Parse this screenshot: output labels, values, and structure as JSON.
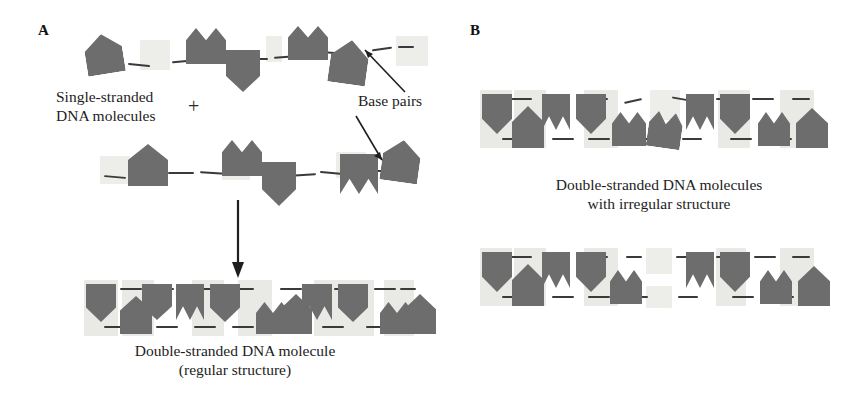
{
  "figure": {
    "type": "scientific-diagram",
    "background_color": "#ffffff",
    "nucleotide_color": "#6d6d6d",
    "basepair_halo_color": "#e9e9e5",
    "backbone_color": "#3a3a3a",
    "text_color": "#1d1d1d"
  },
  "panel_a": {
    "label": "A",
    "single_stranded_caption": "Single-stranded\nDNA molecules",
    "plus_symbol": "+",
    "base_pairs_label": "Base pairs",
    "product_caption": "Double-stranded DNA molecule\n(regular structure)",
    "arrow_down": "reaction-arrow-down",
    "base_pair_pointer_count": 2,
    "top_strand_shapes": [
      "house",
      "peaks",
      "chevron",
      "peaks",
      "house",
      "dash"
    ],
    "bottom_strand_shapes": [
      "house",
      "peaks",
      "chevron",
      "notch",
      "house"
    ],
    "product_top_row_shapes": [
      "chevron",
      "chevron",
      "chevron",
      "peaks",
      "chevron",
      "chevron",
      "peaks"
    ],
    "product_bottom_row_shapes": [
      "house",
      "house",
      "peaks",
      "house",
      "house",
      "house"
    ]
  },
  "panel_b": {
    "label": "B",
    "caption": "Double-stranded DNA molecules\nwith irregular structure",
    "duplex_count": 2,
    "duplex_top_shapes": [
      "chevron",
      "house",
      "notch",
      "chevron",
      "peaks",
      "peaks",
      "notch",
      "chevron",
      "peaks",
      "house"
    ],
    "duplex_bottom_shapes": [
      "chevron",
      "house",
      "notch",
      "chevron",
      "peaks",
      "notch",
      "chevron",
      "peaks",
      "house"
    ],
    "irregularity_top": "mismatched bulge near centre with unpaired backbone ends",
    "irregularity_bottom": "open bubble gap in the centre of the duplex"
  }
}
